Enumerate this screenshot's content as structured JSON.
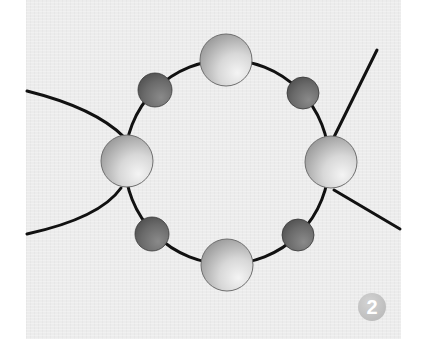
{
  "diagram": {
    "type": "beading-instruction",
    "step_number": "2",
    "colors": {
      "background": "#ececec",
      "thread": "#111111",
      "large_bead_light": "#f2f2f2",
      "large_bead_dark": "#9a9a9a",
      "small_bead_light": "#8a8a8a",
      "small_bead_dark": "#4e4e4e",
      "badge": "#bdbdbd"
    },
    "ring": {
      "cx": 227,
      "cy": 162,
      "r": 102
    },
    "large_beads": [
      {
        "id": "top",
        "cx": 226,
        "cy": 60,
        "r": 26
      },
      {
        "id": "right",
        "cx": 331,
        "cy": 162,
        "r": 26
      },
      {
        "id": "bottom",
        "cx": 227,
        "cy": 265,
        "r": 26
      },
      {
        "id": "left",
        "cx": 127,
        "cy": 161,
        "r": 26
      }
    ],
    "small_beads": [
      {
        "id": "top-left",
        "cx": 155,
        "cy": 90,
        "r": 17
      },
      {
        "id": "top-right",
        "cx": 303,
        "cy": 93,
        "r": 16
      },
      {
        "id": "bottom-right",
        "cx": 298,
        "cy": 235,
        "r": 16
      },
      {
        "id": "bottom-left",
        "cx": 152,
        "cy": 234,
        "r": 17
      }
    ],
    "thread_tails": [
      {
        "id": "left-upper",
        "path": "M27,91 Q95,108 124,137"
      },
      {
        "id": "left-lower",
        "path": "M27,234 Q100,218 121,188"
      },
      {
        "id": "right-upper",
        "path": "M334,137 L377,50"
      },
      {
        "id": "right-lower",
        "path": "M334,190 L400,229"
      }
    ]
  }
}
